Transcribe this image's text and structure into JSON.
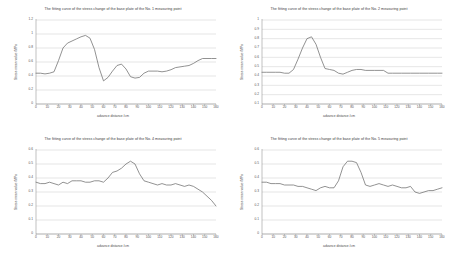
{
  "page": {
    "background": "#ffffff",
    "grid_color": "#c8c8c8",
    "axis_color": "#808080",
    "series_color": "#6e6e6e",
    "layout": "2x2 grid of line charts"
  },
  "charts": [
    {
      "id": "chart-no1",
      "title": "The fitting curve of the stress change of the base plate of the No. 1 measuring point",
      "xlabel": "advance distance /cm",
      "ylabel": "Stress mean value /MPa",
      "xticks": [
        "0",
        "10",
        "20",
        "30",
        "40",
        "50",
        "60",
        "70",
        "80",
        "90",
        "100",
        "110",
        "120",
        "130",
        "140",
        "150",
        "160"
      ],
      "yticks": [
        "0",
        "0.2",
        "0.4",
        "0.6",
        "0.8",
        "1",
        "1.2"
      ]
    },
    {
      "id": "chart-no2",
      "title": "The fitting curve of the stress change of the base plate of the No. 2 measuring point",
      "xlabel": "advance distance /cm",
      "ylabel": "Stress mean value /MPa",
      "xticks": [
        "0",
        "10",
        "20",
        "30",
        "40",
        "50",
        "60",
        "70",
        "80",
        "90",
        "100",
        "110",
        "120",
        "130",
        "140",
        "150",
        "160"
      ],
      "yticks": [
        "0.1",
        "0.2",
        "0.3",
        "0.4",
        "0.5",
        "0.6",
        "0.7",
        "0.8",
        "0.9",
        "1"
      ]
    },
    {
      "id": "chart-no4",
      "title": "The fitting curve of the stress change of the base plate of the No. 4 measuring point",
      "xlabel": "advance distance /cm",
      "ylabel": "Stress mean value /MPa",
      "xticks": [
        "0",
        "10",
        "20",
        "30",
        "40",
        "50",
        "60",
        "70",
        "80",
        "90",
        "100",
        "110",
        "120",
        "130",
        "140",
        "150",
        "160"
      ],
      "yticks": [
        "0",
        "0.1",
        "0.2",
        "0.3",
        "0.4",
        "0.5",
        "0.6"
      ]
    },
    {
      "id": "chart-no5",
      "title": "The fitting curve of the stress change of the base plate of the No. 5 measuring point",
      "xlabel": "advance distance /cm",
      "ylabel": "Stress mean value /MPa",
      "xticks": [
        "0",
        "10",
        "20",
        "30",
        "40",
        "50",
        "60",
        "70",
        "80",
        "90",
        "100",
        "110",
        "120",
        "130",
        "140",
        "150",
        "160"
      ],
      "yticks": [
        "0",
        "0.1",
        "0.2",
        "0.3",
        "0.4",
        "0.5",
        "0.6"
      ]
    }
  ],
  "chart_data": [
    {
      "type": "line",
      "title": "The fitting curve of the stress change of the base plate of the No. 1 measuring point",
      "xlabel": "advance distance /cm",
      "ylabel": "Stress mean value /MPa",
      "xlim": [
        0,
        160
      ],
      "ylim": [
        0,
        1.2
      ],
      "grid": true,
      "legend": "none",
      "x": [
        0,
        4,
        8,
        12,
        16,
        20,
        24,
        28,
        32,
        36,
        40,
        44,
        48,
        52,
        56,
        60,
        64,
        68,
        72,
        76,
        80,
        84,
        88,
        92,
        96,
        100,
        104,
        108,
        112,
        116,
        120,
        124,
        128,
        132,
        136,
        140,
        144,
        148,
        152,
        156,
        160
      ],
      "series": [
        {
          "name": "No. 1 measuring point",
          "values": [
            0.44,
            0.44,
            0.43,
            0.44,
            0.46,
            0.62,
            0.8,
            0.87,
            0.9,
            0.93,
            0.96,
            0.98,
            0.94,
            0.78,
            0.52,
            0.33,
            0.38,
            0.47,
            0.55,
            0.57,
            0.5,
            0.39,
            0.37,
            0.38,
            0.44,
            0.47,
            0.47,
            0.47,
            0.46,
            0.47,
            0.49,
            0.52,
            0.53,
            0.54,
            0.55,
            0.58,
            0.62,
            0.65,
            0.65,
            0.65,
            0.65
          ]
        }
      ]
    },
    {
      "type": "line",
      "title": "The fitting curve of the stress change of the base plate of the No. 2 measuring point",
      "xlabel": "advance distance /cm",
      "ylabel": "Stress mean value /MPa",
      "xlim": [
        0,
        160
      ],
      "ylim": [
        0.1,
        1.0
      ],
      "grid": true,
      "legend": "none",
      "x": [
        0,
        4,
        8,
        12,
        16,
        20,
        24,
        28,
        32,
        36,
        40,
        44,
        48,
        52,
        56,
        60,
        64,
        68,
        72,
        76,
        80,
        84,
        88,
        92,
        96,
        100,
        104,
        108,
        112,
        116,
        120,
        124,
        128,
        132,
        136,
        140,
        144,
        148,
        152,
        156,
        160
      ],
      "series": [
        {
          "name": "No. 2 measuring point",
          "values": [
            0.44,
            0.44,
            0.44,
            0.44,
            0.44,
            0.43,
            0.43,
            0.47,
            0.58,
            0.7,
            0.8,
            0.82,
            0.74,
            0.6,
            0.48,
            0.47,
            0.46,
            0.43,
            0.42,
            0.44,
            0.46,
            0.47,
            0.47,
            0.46,
            0.46,
            0.46,
            0.46,
            0.46,
            0.43,
            0.43,
            0.43,
            0.43,
            0.43,
            0.43,
            0.43,
            0.43,
            0.43,
            0.43,
            0.43,
            0.43,
            0.43
          ]
        }
      ]
    },
    {
      "type": "line",
      "title": "The fitting curve of the stress change of the base plate of the No. 4 measuring point",
      "xlabel": "advance distance /cm",
      "ylabel": "Stress mean value /MPa",
      "xlim": [
        0,
        160
      ],
      "ylim": [
        0,
        0.6
      ],
      "grid": true,
      "legend": "none",
      "x": [
        0,
        4,
        8,
        12,
        16,
        20,
        24,
        28,
        32,
        36,
        40,
        44,
        48,
        52,
        56,
        60,
        64,
        68,
        72,
        76,
        80,
        84,
        88,
        92,
        96,
        100,
        104,
        108,
        112,
        116,
        120,
        124,
        128,
        132,
        136,
        140,
        144,
        148,
        152,
        156,
        160
      ],
      "series": [
        {
          "name": "No. 4 measuring point",
          "values": [
            0.37,
            0.36,
            0.36,
            0.37,
            0.36,
            0.35,
            0.37,
            0.36,
            0.38,
            0.38,
            0.38,
            0.37,
            0.37,
            0.38,
            0.38,
            0.37,
            0.4,
            0.44,
            0.45,
            0.47,
            0.5,
            0.52,
            0.5,
            0.43,
            0.38,
            0.37,
            0.36,
            0.35,
            0.36,
            0.35,
            0.35,
            0.36,
            0.35,
            0.34,
            0.35,
            0.34,
            0.32,
            0.3,
            0.27,
            0.24,
            0.2
          ]
        }
      ]
    },
    {
      "type": "line",
      "title": "The fitting curve of the stress change of the base plate of the No. 5 measuring point",
      "xlabel": "advance distance /cm",
      "ylabel": "Stress mean value /MPa",
      "xlim": [
        0,
        160
      ],
      "ylim": [
        0,
        0.6
      ],
      "grid": true,
      "legend": "none",
      "x": [
        0,
        4,
        8,
        12,
        16,
        20,
        24,
        28,
        32,
        36,
        40,
        44,
        48,
        52,
        56,
        60,
        64,
        68,
        72,
        76,
        80,
        84,
        88,
        92,
        96,
        100,
        104,
        108,
        112,
        116,
        120,
        124,
        128,
        132,
        136,
        140,
        144,
        148,
        152,
        156,
        160
      ],
      "series": [
        {
          "name": "No. 5 measuring point",
          "values": [
            0.37,
            0.37,
            0.36,
            0.36,
            0.36,
            0.35,
            0.35,
            0.35,
            0.34,
            0.34,
            0.33,
            0.32,
            0.31,
            0.33,
            0.34,
            0.33,
            0.33,
            0.38,
            0.48,
            0.52,
            0.52,
            0.51,
            0.44,
            0.35,
            0.34,
            0.35,
            0.36,
            0.35,
            0.34,
            0.35,
            0.34,
            0.33,
            0.33,
            0.34,
            0.3,
            0.29,
            0.3,
            0.31,
            0.31,
            0.32,
            0.33
          ]
        }
      ]
    }
  ]
}
